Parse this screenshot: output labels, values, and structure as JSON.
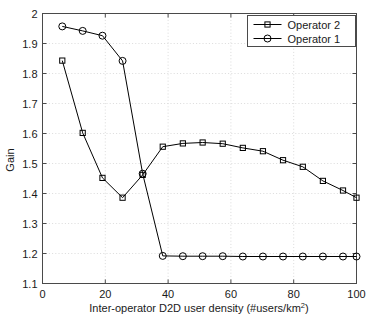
{
  "chart_data": {
    "type": "line",
    "title": "",
    "xlabel": "Inter-operator D2D user density (#users/km2)",
    "xlabel_base": "Inter-operator D2D user density (#users/km",
    "xlabel_sup": "2",
    "xlabel_tail": ")",
    "ylabel": "Gain",
    "xlim": [
      0,
      100
    ],
    "ylim": [
      1.1,
      2.0
    ],
    "xticks": [
      0,
      20,
      40,
      60,
      80,
      100
    ],
    "yticks": [
      1.1,
      1.2,
      1.3,
      1.4,
      1.5,
      1.6,
      1.7,
      1.8,
      1.9,
      2
    ],
    "xticklabels": [
      "0",
      "20",
      "40",
      "60",
      "80",
      "100"
    ],
    "yticklabels": [
      "1.1",
      "1.2",
      "1.3",
      "1.4",
      "1.5",
      "1.6",
      "1.7",
      "1.8",
      "1.9",
      "2"
    ],
    "grid": true,
    "legend_position": "top-right",
    "series": [
      {
        "name": "Operator 2",
        "marker": "square",
        "color": "#000000",
        "points": [
          [
            6.3,
            1.843
          ],
          [
            12.8,
            1.602
          ],
          [
            19.1,
            1.452
          ],
          [
            25.5,
            1.386
          ],
          [
            31.9,
            1.462
          ],
          [
            38.3,
            1.556
          ],
          [
            44.7,
            1.567
          ],
          [
            51.0,
            1.57
          ],
          [
            57.4,
            1.566
          ],
          [
            63.8,
            1.552
          ],
          [
            70.2,
            1.541
          ],
          [
            76.6,
            1.511
          ],
          [
            82.9,
            1.489
          ],
          [
            89.3,
            1.442
          ],
          [
            95.7,
            1.41
          ],
          [
            100.0,
            1.386
          ]
        ]
      },
      {
        "name": "Operator 1",
        "marker": "circle",
        "color": "#000000",
        "points": [
          [
            6.3,
            1.957
          ],
          [
            12.8,
            1.942
          ],
          [
            19.1,
            1.926
          ],
          [
            25.5,
            1.842
          ],
          [
            31.9,
            1.466
          ],
          [
            38.3,
            1.192
          ],
          [
            44.7,
            1.191
          ],
          [
            51.0,
            1.191
          ],
          [
            57.4,
            1.191
          ],
          [
            63.8,
            1.19
          ],
          [
            70.2,
            1.19
          ],
          [
            76.6,
            1.19
          ],
          [
            82.9,
            1.19
          ],
          [
            89.3,
            1.19
          ],
          [
            95.7,
            1.19
          ],
          [
            100.0,
            1.19
          ]
        ]
      }
    ],
    "legend": [
      {
        "label": "Operator 2",
        "marker": "square"
      },
      {
        "label": "Operator 1",
        "marker": "circle"
      }
    ]
  }
}
